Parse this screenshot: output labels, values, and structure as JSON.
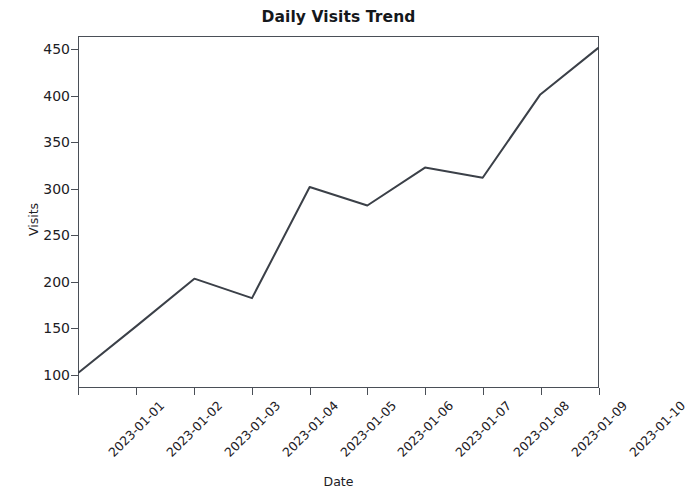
{
  "chart_data": {
    "type": "line",
    "title": "Daily Visits Trend",
    "xlabel": "Date",
    "ylabel": "Visits",
    "grid": false,
    "legend": null,
    "line_color": "#3b4048",
    "line_width": 2,
    "categories": [
      "2023-01-01",
      "2023-01-02",
      "2023-01-03",
      "2023-01-04",
      "2023-01-05",
      "2023-01-06",
      "2023-01-07",
      "2023-01-08",
      "2023-01-09",
      "2023-01-10"
    ],
    "values": [
      102,
      152,
      203,
      182,
      302,
      282,
      323,
      312,
      402,
      452
    ],
    "x_tick_labels": [
      "2023-01-01",
      "2023-01-02",
      "2023-01-03",
      "2023-01-04",
      "2023-01-05",
      "2023-01-06",
      "2023-01-07",
      "2023-01-08",
      "2023-01-09",
      "2023-01-10"
    ],
    "x_tick_rotation": -45,
    "y_tick_labels": [
      "100",
      "150",
      "200",
      "250",
      "300",
      "350",
      "400",
      "450"
    ],
    "y_ticks": [
      100,
      150,
      200,
      250,
      300,
      350,
      400,
      450
    ],
    "ylim": [
      86,
      464
    ],
    "xlim": [
      0,
      9
    ]
  }
}
